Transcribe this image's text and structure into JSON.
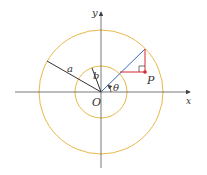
{
  "diagram": {
    "labels": {
      "y_axis": "y",
      "x_axis": "x",
      "origin": "O",
      "outer_radius": "a",
      "inner_radius": "b",
      "angle": "θ",
      "point": "P"
    },
    "colors": {
      "axes": "#555555",
      "circles": "#e8b84a",
      "ray": "#3a66b8",
      "construction": "#d6282f",
      "radius_lines": "#333333"
    }
  }
}
